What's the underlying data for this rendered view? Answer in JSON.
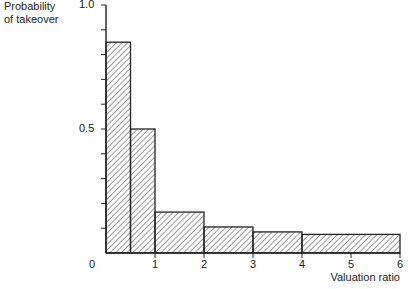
{
  "chart_data": {
    "type": "bar",
    "title": "",
    "xlabel": "Valuation ratio",
    "ylabel": "Probability of takeover",
    "ylabel_lines": [
      "Probability",
      "of takeover"
    ],
    "xlim": [
      0,
      6
    ],
    "ylim": [
      0,
      1.0
    ],
    "x_ticks": [
      "0",
      "1",
      "2",
      "3",
      "4",
      "5",
      "6"
    ],
    "y_ticks": [
      "0.5",
      "1.0"
    ],
    "y_minor_tick_step": 0.1,
    "grid": false,
    "bar_style": "diagonal hatch, black outline",
    "bins": [
      {
        "x_start": 0.0,
        "x_end": 0.5,
        "value": 0.85
      },
      {
        "x_start": 0.5,
        "x_end": 1.0,
        "value": 0.5
      },
      {
        "x_start": 1.0,
        "x_end": 2.0,
        "value": 0.165
      },
      {
        "x_start": 2.0,
        "x_end": 3.0,
        "value": 0.105
      },
      {
        "x_start": 3.0,
        "x_end": 4.0,
        "value": 0.085
      },
      {
        "x_start": 4.0,
        "x_end": 6.0,
        "value": 0.075
      }
    ]
  },
  "colors": {
    "axis": "#222222",
    "hatch": "#333333",
    "background": "#ffffff"
  }
}
